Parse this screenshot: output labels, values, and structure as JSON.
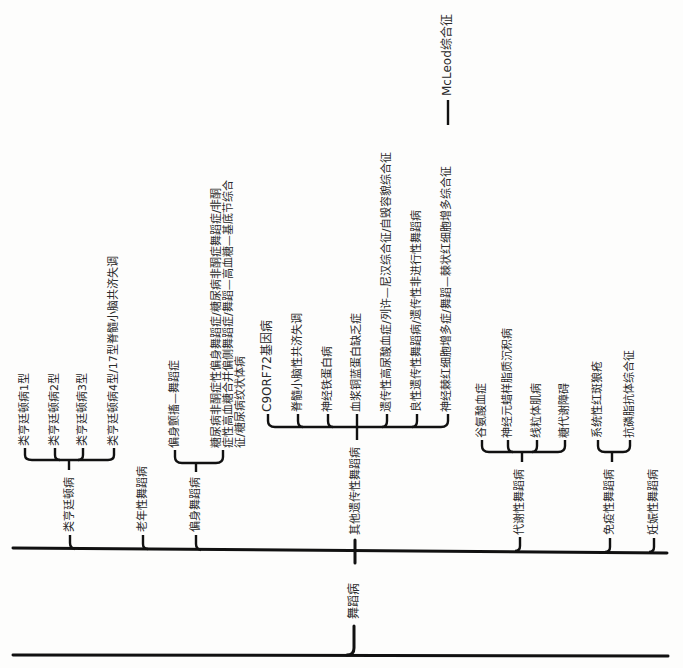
{
  "root": {
    "label": "舞蹈病"
  },
  "groups": [
    {
      "label": "类亨廷顿病",
      "children": [
        "类亨廷顿病1型",
        "类亨廷顿病2型",
        "类亨廷顿病3型",
        "类亨廷顿病4型/17型脊髓小脑共济失调"
      ]
    },
    {
      "label": "老年性舞蹈病",
      "children": []
    },
    {
      "label": "偏身舞蹈病",
      "children": [
        "偏身颤搐—舞蹈症",
        "糖尿病非酮症性偏身舞蹈症/糖尿病非酮症舞蹈症/非酮症性高血糖合并偏侧舞蹈症/舞蹈—高血糖—基底节综合征/糖尿病纹状体病"
      ]
    },
    {
      "label": "其他遗传性舞蹈病",
      "children": [
        "C9ORF72基因病",
        "脊髓小脑性共济失调",
        "神经铁蛋白病",
        "血浆铜蓝蛋白缺乏症",
        "遗传性高尿酸血症/列许—尼汉综合征/自毁容貌综合征",
        "良性遗传性舞蹈病/遗传性非进行性舞蹈病",
        "神经棘红细胞增多症/舞蹈—棘状红细胞增多综合征"
      ],
      "extra": "McLeod综合征"
    },
    {
      "label": "代谢性舞蹈病",
      "children": [
        "谷氨酸血症",
        "神经元蜡样脂质沉积病",
        "线粒体肌病",
        "糖代谢障碍"
      ]
    },
    {
      "label": "免疫性舞蹈病",
      "children": [
        "系统性红斑狼疮",
        "抗磷脂抗体综合征"
      ]
    },
    {
      "label": "妊娠性舞蹈病",
      "children": []
    }
  ],
  "colors": {
    "line": "#111111",
    "text": "#2a2a2a",
    "background": "#fdfdfc"
  }
}
